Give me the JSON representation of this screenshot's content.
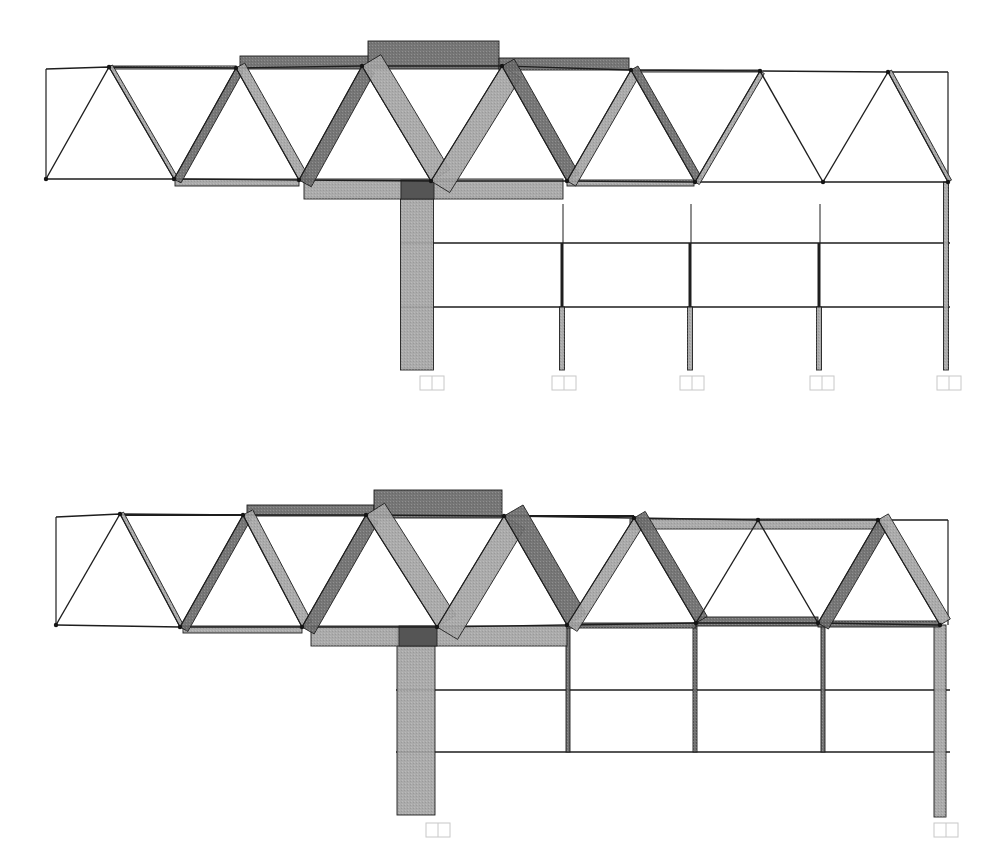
{
  "colors": {
    "background": "#ffffff",
    "line": "#1e1e1e",
    "compression": "#6a6a6a",
    "tension": "#a4a4a4",
    "overlap": "#555555",
    "joint": "#151515",
    "support": "#c8c8c8"
  },
  "diagrams": [
    {
      "id": "top",
      "truss": {
        "top_nodes": [
          [
            46,
            69
          ],
          [
            109,
            67
          ],
          [
            236,
            68
          ],
          [
            362,
            66
          ],
          [
            502,
            66
          ],
          [
            631,
            70
          ],
          [
            760,
            71
          ],
          [
            888,
            72
          ],
          [
            948,
            72
          ]
        ],
        "bottom_nodes": [
          [
            46,
            179
          ],
          [
            174,
            179
          ],
          [
            299,
            180
          ],
          [
            431,
            181
          ],
          [
            567,
            181
          ],
          [
            695,
            182
          ],
          [
            823,
            182
          ],
          [
            948,
            182
          ]
        ],
        "diagonals": [
          {
            "from": [
              46,
              179
            ],
            "to": [
              109,
              67
            ],
            "w": 2,
            "kind": "line"
          },
          {
            "from": [
              109,
              67
            ],
            "to": [
              174,
              179
            ],
            "w": 4,
            "kind": "tension"
          },
          {
            "from": [
              174,
              179
            ],
            "to": [
              236,
              68
            ],
            "w": 8,
            "kind": "compression"
          },
          {
            "from": [
              236,
              68
            ],
            "to": [
              299,
              180
            ],
            "w": 10,
            "kind": "tension"
          },
          {
            "from": [
              299,
              180
            ],
            "to": [
              362,
              66
            ],
            "w": 14,
            "kind": "compression"
          },
          {
            "from": [
              362,
              66
            ],
            "to": [
              431,
              181
            ],
            "w": 22,
            "kind": "tension"
          },
          {
            "from": [
              431,
              181
            ],
            "to": [
              502,
              66
            ],
            "w": 22,
            "kind": "tension"
          },
          {
            "from": [
              502,
              66
            ],
            "to": [
              567,
              181
            ],
            "w": 14,
            "kind": "compression"
          },
          {
            "from": [
              567,
              181
            ],
            "to": [
              631,
              70
            ],
            "w": 10,
            "kind": "tension"
          },
          {
            "from": [
              631,
              70
            ],
            "to": [
              695,
              182
            ],
            "w": 8,
            "kind": "compression"
          },
          {
            "from": [
              695,
              182
            ],
            "to": [
              760,
              71
            ],
            "w": 5,
            "kind": "tension"
          },
          {
            "from": [
              760,
              71
            ],
            "to": [
              823,
              182
            ],
            "w": 2,
            "kind": "line"
          },
          {
            "from": [
              823,
              182
            ],
            "to": [
              888,
              72
            ],
            "w": 2,
            "kind": "line"
          },
          {
            "from": [
              888,
              72
            ],
            "to": [
              948,
              182
            ],
            "w": 4,
            "kind": "tension"
          }
        ],
        "top_chord_bands": [
          {
            "x": 109,
            "y": 66,
            "w": 127,
            "h": 3,
            "kind": "tension"
          },
          {
            "x": 240,
            "y": 56,
            "w": 129,
            "h": 13,
            "kind": "compression"
          },
          {
            "x": 368,
            "y": 41,
            "w": 131,
            "h": 28,
            "kind": "compression"
          },
          {
            "x": 499,
            "y": 58,
            "w": 130,
            "h": 12,
            "kind": "compression"
          },
          {
            "x": 631,
            "y": 70,
            "w": 129,
            "h": 2,
            "kind": "tension"
          }
        ],
        "bottom_chord_bands": [
          {
            "x": 175,
            "y": 179,
            "w": 124,
            "h": 7,
            "kind": "tension"
          },
          {
            "x": 304,
            "y": 179,
            "w": 259,
            "h": 20,
            "kind": "tension"
          },
          {
            "x": 567,
            "y": 180,
            "w": 127,
            "h": 6,
            "kind": "tension"
          }
        ],
        "end_post": {
          "from": [
            46,
            69
          ],
          "to": [
            46,
            179
          ]
        },
        "right_post": {
          "from": [
            948,
            72
          ],
          "to": [
            948,
            182
          ]
        }
      },
      "frame": {
        "beams_y": [
          243,
          307
        ],
        "beam_x": [
          401,
          950
        ],
        "columns": [
          {
            "x": 417,
            "w": 33,
            "top": 180,
            "bottom": 370,
            "kind": "tension"
          },
          {
            "x": 563,
            "w": 1,
            "top": 204,
            "bottom": 243,
            "kind": "line"
          },
          {
            "x": 562,
            "w": 3,
            "top": 243,
            "bottom": 307,
            "kind": "line"
          },
          {
            "x": 562,
            "w": 5,
            "top": 307,
            "bottom": 370,
            "kind": "tension"
          },
          {
            "x": 691,
            "w": 1,
            "top": 204,
            "bottom": 243,
            "kind": "line"
          },
          {
            "x": 690,
            "w": 3,
            "top": 243,
            "bottom": 307,
            "kind": "line"
          },
          {
            "x": 690,
            "w": 5,
            "top": 307,
            "bottom": 370,
            "kind": "tension"
          },
          {
            "x": 820,
            "w": 1,
            "top": 204,
            "bottom": 243,
            "kind": "line"
          },
          {
            "x": 819,
            "w": 3,
            "top": 243,
            "bottom": 307,
            "kind": "line"
          },
          {
            "x": 819,
            "w": 5,
            "top": 307,
            "bottom": 370,
            "kind": "tension"
          },
          {
            "x": 946,
            "w": 5,
            "top": 182,
            "bottom": 370,
            "kind": "tension"
          }
        ],
        "supports": [
          {
            "x": 420,
            "y": 376
          },
          {
            "x": 552,
            "y": 376
          },
          {
            "x": 680,
            "y": 376
          },
          {
            "x": 810,
            "y": 376
          },
          {
            "x": 937,
            "y": 376
          }
        ],
        "overlap_box": {
          "x": 401,
          "y": 180,
          "w": 33,
          "h": 19
        }
      }
    },
    {
      "id": "bottom",
      "truss": {
        "top_nodes": [
          [
            56,
            517
          ],
          [
            120,
            514
          ],
          [
            243,
            515
          ],
          [
            366,
            515
          ],
          [
            504,
            516
          ],
          [
            634,
            518
          ],
          [
            758,
            520
          ],
          [
            878,
            520
          ],
          [
            948,
            520
          ]
        ],
        "bottom_nodes": [
          [
            56,
            625
          ],
          [
            180,
            627
          ],
          [
            302,
            627
          ],
          [
            437,
            627
          ],
          [
            567,
            625
          ],
          [
            696,
            623
          ],
          [
            818,
            623
          ],
          [
            940,
            625
          ]
        ],
        "diagonals": [
          {
            "from": [
              56,
              625
            ],
            "to": [
              120,
              514
            ],
            "w": 2,
            "kind": "line"
          },
          {
            "from": [
              120,
              514
            ],
            "to": [
              180,
              627
            ],
            "w": 4,
            "kind": "tension"
          },
          {
            "from": [
              180,
              627
            ],
            "to": [
              243,
              515
            ],
            "w": 9,
            "kind": "compression"
          },
          {
            "from": [
              243,
              515
            ],
            "to": [
              302,
              627
            ],
            "w": 11,
            "kind": "tension"
          },
          {
            "from": [
              302,
              627
            ],
            "to": [
              366,
              515
            ],
            "w": 14,
            "kind": "compression"
          },
          {
            "from": [
              366,
              515
            ],
            "to": [
              437,
              627
            ],
            "w": 22,
            "kind": "tension"
          },
          {
            "from": [
              437,
              627
            ],
            "to": [
              504,
              516
            ],
            "w": 24,
            "kind": "tension"
          },
          {
            "from": [
              504,
              516
            ],
            "to": [
              567,
              625
            ],
            "w": 22,
            "kind": "compression"
          },
          {
            "from": [
              567,
              625
            ],
            "to": [
              634,
              518
            ],
            "w": 12,
            "kind": "tension"
          },
          {
            "from": [
              634,
              518
            ],
            "to": [
              696,
              623
            ],
            "w": 13,
            "kind": "compression"
          },
          {
            "from": [
              696,
              623
            ],
            "to": [
              758,
              520
            ],
            "w": 2,
            "kind": "line"
          },
          {
            "from": [
              758,
              520
            ],
            "to": [
              818,
              623
            ],
            "w": 2,
            "kind": "line"
          },
          {
            "from": [
              818,
              623
            ],
            "to": [
              878,
              520
            ],
            "w": 12,
            "kind": "compression"
          },
          {
            "from": [
              878,
              520
            ],
            "to": [
              940,
              625
            ],
            "w": 12,
            "kind": "tension"
          }
        ],
        "top_chord_bands": [
          {
            "x": 120,
            "y": 514,
            "w": 123,
            "h": 2,
            "kind": "line"
          },
          {
            "x": 247,
            "y": 505,
            "w": 127,
            "h": 11,
            "kind": "compression"
          },
          {
            "x": 374,
            "y": 490,
            "w": 128,
            "h": 28,
            "kind": "compression"
          },
          {
            "x": 504,
            "y": 515,
            "w": 130,
            "h": 2,
            "kind": "line"
          },
          {
            "x": 630,
            "y": 519,
            "w": 248,
            "h": 10,
            "kind": "tension"
          }
        ],
        "bottom_chord_bands": [
          {
            "x": 183,
            "y": 626,
            "w": 119,
            "h": 7,
            "kind": "tension"
          },
          {
            "x": 311,
            "y": 626,
            "w": 256,
            "h": 20,
            "kind": "tension"
          },
          {
            "x": 567,
            "y": 623,
            "w": 129,
            "h": 5,
            "kind": "compression"
          },
          {
            "x": 696,
            "y": 617,
            "w": 122,
            "h": 9,
            "kind": "compression"
          },
          {
            "x": 818,
            "y": 621,
            "w": 122,
            "h": 6,
            "kind": "compression"
          }
        ],
        "end_post": {
          "from": [
            56,
            517
          ],
          "to": [
            56,
            625
          ]
        },
        "right_post": {
          "from": [
            948,
            520
          ],
          "to": [
            948,
            625
          ]
        }
      },
      "frame": {
        "beams_y": [
          690,
          752
        ],
        "beam_x": [
          396,
          950
        ],
        "columns": [
          {
            "x": 416,
            "w": 38,
            "top": 627,
            "bottom": 815,
            "kind": "tension"
          },
          {
            "x": 568,
            "w": 4,
            "top": 625,
            "bottom": 752,
            "kind": "compression"
          },
          {
            "x": 695,
            "w": 4,
            "top": 623,
            "bottom": 752,
            "kind": "compression"
          },
          {
            "x": 823,
            "w": 4,
            "top": 623,
            "bottom": 752,
            "kind": "compression"
          },
          {
            "x": 940,
            "w": 12,
            "top": 625,
            "bottom": 817,
            "kind": "tension"
          }
        ],
        "supports": [
          {
            "x": 426,
            "y": 823
          },
          {
            "x": 934,
            "y": 823
          }
        ],
        "overlap_box": {
          "x": 399,
          "y": 626,
          "w": 38,
          "h": 20
        }
      }
    }
  ]
}
